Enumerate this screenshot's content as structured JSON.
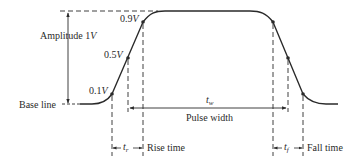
{
  "diagram": {
    "colors": {
      "stroke": "#2a2a2a",
      "background": "#ffffff"
    },
    "labels": {
      "amplitude": "Amplitude 1",
      "amplitude_unit": "V",
      "base_line": "Base line",
      "level_90": "0.9",
      "level_50": "0.5",
      "level_10": "0.1",
      "level_unit": "V",
      "pulse_width_symbol": "t",
      "pulse_width_sub": "w",
      "pulse_width": "Pulse width",
      "rise_symbol": "t",
      "rise_sub": "r",
      "rise_time": "Rise time",
      "fall_symbol": "t",
      "fall_sub": "f",
      "fall_time": "Fall time"
    },
    "levels": [
      {
        "name": "0.9V",
        "fraction": 0.9
      },
      {
        "name": "0.5V",
        "fraction": 0.5
      },
      {
        "name": "0.1V",
        "fraction": 0.1
      }
    ]
  }
}
